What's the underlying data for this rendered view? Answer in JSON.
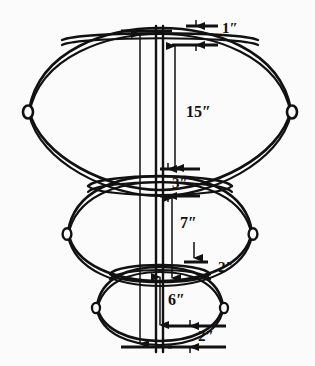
{
  "figure": {
    "type": "technical-line-drawing",
    "background_color": "#fbfbfb",
    "line_color": "#111111",
    "unit_symbol": "″"
  },
  "dimensions": [
    {
      "id": "top-offset",
      "label": "1″",
      "value": 1,
      "unit": "in",
      "x": 222,
      "y": 33,
      "anchor": "start"
    },
    {
      "id": "top-tier-height",
      "label": "15″",
      "value": 15,
      "unit": "in",
      "x": 186,
      "y": 117,
      "anchor": "start"
    },
    {
      "id": "top-mid-gap",
      "label": "3″",
      "value": 3,
      "unit": "in",
      "x": 172,
      "y": 186,
      "anchor": "start"
    },
    {
      "id": "mid-tier-height",
      "label": "7″",
      "value": 7,
      "unit": "in",
      "x": 180,
      "y": 228,
      "anchor": "start"
    },
    {
      "id": "mid-bottom-gap",
      "label": "2″",
      "value": 2,
      "unit": "in",
      "x": 218,
      "y": 270,
      "anchor": "start"
    },
    {
      "id": "low-tier-height",
      "label": "6″",
      "value": 6,
      "unit": "in",
      "x": 168,
      "y": 303,
      "anchor": "start"
    },
    {
      "id": "base-offset",
      "label": "2″",
      "value": 2,
      "unit": "in",
      "x": 198,
      "y": 341,
      "anchor": "start"
    }
  ],
  "structure": {
    "center_rod": {
      "name": "center-rod",
      "x": 160,
      "top": 26,
      "bottom": 352
    },
    "tiers": [
      {
        "id": "top-tier",
        "name": "upper-ring",
        "cy": 98,
        "rx": 131,
        "ry": 70,
        "has_eyelets": true
      },
      {
        "id": "middle-tier",
        "name": "middle-ring",
        "cy": 228,
        "rx": 92,
        "ry": 50,
        "has_eyelets": true
      },
      {
        "id": "bottom-tier",
        "name": "lower-ring",
        "cy": 303,
        "rx": 63,
        "ry": 33,
        "has_eyelets": true
      }
    ],
    "horizontal_bands": [
      {
        "id": "band-top",
        "cy": 38,
        "rx": 100,
        "ry": 9
      },
      {
        "id": "band-middle",
        "cy": 183,
        "rx": 73,
        "ry": 13
      },
      {
        "id": "band-lower",
        "cy": 271,
        "rx": 51,
        "ry": 11
      },
      {
        "id": "band-base",
        "cy": 336,
        "rx": 37,
        "ry": 8
      }
    ]
  }
}
